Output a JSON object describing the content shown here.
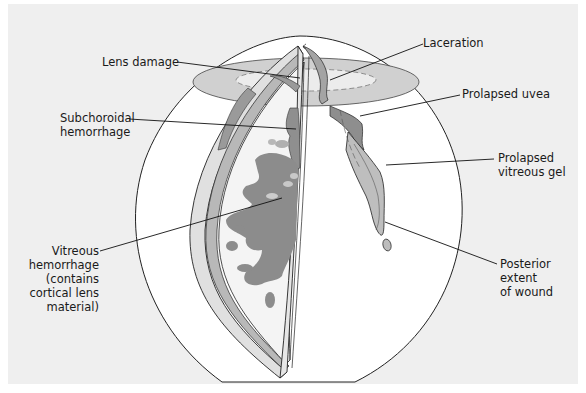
{
  "figure": {
    "colors": {
      "background": "#efefef",
      "globe": "#ffffff",
      "tissue_light": "#d2d2d2",
      "tissue_mid": "#a8a8a8",
      "tissue_dark": "#8c8c8c",
      "outline": "#222222"
    }
  },
  "labels": {
    "lens_damage": "Lens damage",
    "laceration": "Laceration",
    "subchoroidal_line1": "Subchoroidal",
    "subchoroidal_line2": "hemorrhage",
    "prolapsed_uvea": "Prolapsed uvea",
    "prolapsed_vitreous_line1": "Prolapsed",
    "prolapsed_vitreous_line2": "vitreous gel",
    "vitreous_line1": "Vitreous",
    "vitreous_line2": "hemorrhage",
    "vitreous_line3": "(contains",
    "vitreous_line4": "cortical lens",
    "vitreous_line5": "material)",
    "posterior_line1": "Posterior",
    "posterior_line2": "extent",
    "posterior_line3": "of wound"
  }
}
